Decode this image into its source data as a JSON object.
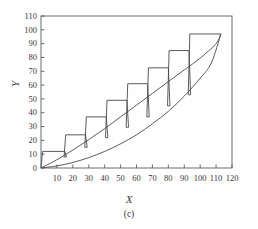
{
  "figure": {
    "caption": "(c)",
    "x_axis_title": "X",
    "y_axis_title": "Y"
  },
  "chart_data": {
    "type": "line",
    "title": "",
    "subtitle": "",
    "caption": "(c)",
    "xlabel": "X",
    "ylabel": "Y",
    "xlim": [
      0,
      120
    ],
    "ylim": [
      0,
      110
    ],
    "xticks": [
      10,
      20,
      30,
      40,
      50,
      60,
      70,
      80,
      90,
      100,
      110,
      120
    ],
    "yticks": [
      0,
      10,
      20,
      30,
      40,
      50,
      60,
      70,
      80,
      90,
      100,
      110
    ],
    "xtick_labels": [
      "10",
      "20",
      "30",
      "40",
      "50",
      "60",
      "70",
      "80",
      "90",
      "100",
      "110",
      "120"
    ],
    "ytick_labels": [
      "0",
      "10",
      "20",
      "30",
      "40",
      "50",
      "60",
      "70",
      "80",
      "90",
      "100",
      "110"
    ],
    "grid": false,
    "legend": "none",
    "frame": "box",
    "line_color": "#4a4a4a",
    "series": [
      {
        "name": "lower-convex-curve",
        "type": "line",
        "points": [
          [
            0,
            0
          ],
          [
            10,
            1.5
          ],
          [
            20,
            4
          ],
          [
            30,
            7.5
          ],
          [
            40,
            12
          ],
          [
            50,
            17.5
          ],
          [
            60,
            24
          ],
          [
            70,
            32
          ],
          [
            80,
            41
          ],
          [
            90,
            52
          ],
          [
            100,
            65
          ],
          [
            107,
            76
          ],
          [
            113,
            97
          ]
        ]
      },
      {
        "name": "middle-curve",
        "type": "line",
        "points": [
          [
            0,
            0
          ],
          [
            10,
            6
          ],
          [
            20,
            13
          ],
          [
            30,
            20.5
          ],
          [
            40,
            28.5
          ],
          [
            50,
            37
          ],
          [
            60,
            45.5
          ],
          [
            70,
            54
          ],
          [
            80,
            62.5
          ],
          [
            90,
            71
          ],
          [
            100,
            79.5
          ],
          [
            110,
            90
          ],
          [
            113,
            97
          ]
        ]
      },
      {
        "name": "staircase",
        "type": "step",
        "step_tops": [
          12,
          24,
          37,
          49,
          61,
          72.5,
          85,
          97
        ],
        "step_left_x": [
          1,
          14.5,
          27.5,
          40.5,
          53.5,
          66.5,
          79.5,
          92.5
        ],
        "step_right_x": [
          15,
          28,
          41,
          54,
          67,
          80,
          93,
          105
        ],
        "riser_bottoms": [
          0,
          8,
          15,
          22,
          29.5,
          37,
          45,
          53
        ],
        "vertices": [
          [
            0,
            0
          ],
          [
            1,
            12
          ],
          [
            15,
            12
          ],
          [
            16,
            8
          ],
          [
            14.5,
            8
          ],
          [
            15.5,
            24
          ],
          [
            28,
            24
          ],
          [
            29,
            15
          ],
          [
            27.5,
            15
          ],
          [
            28.5,
            37
          ],
          [
            41,
            37
          ],
          [
            42,
            22
          ],
          [
            40.5,
            22
          ],
          [
            41.5,
            49
          ],
          [
            54,
            49
          ],
          [
            55,
            29.5
          ],
          [
            53.5,
            29.5
          ],
          [
            54.5,
            61
          ],
          [
            67,
            61
          ],
          [
            68,
            37
          ],
          [
            66.5,
            37
          ],
          [
            67.5,
            72.5
          ],
          [
            80,
            72.5
          ],
          [
            81,
            45
          ],
          [
            79.5,
            45
          ],
          [
            80.5,
            85
          ],
          [
            93,
            85
          ],
          [
            94,
            53
          ],
          [
            92.5,
            53
          ],
          [
            93.5,
            97
          ],
          [
            105,
            97
          ],
          [
            113,
            97
          ]
        ]
      }
    ]
  }
}
